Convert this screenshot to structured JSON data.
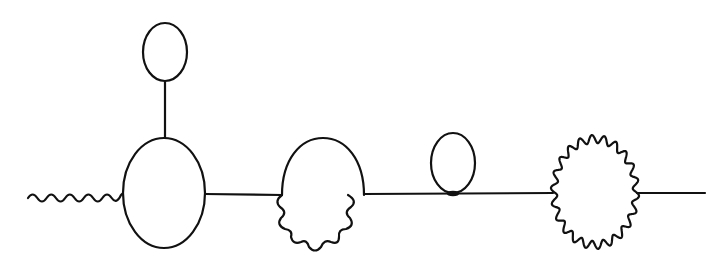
{
  "diagram": {
    "type": "feynman-diagram",
    "stroke_color": "#111111",
    "background": "#ffffff",
    "stroke_width": 2.2,
    "elements": [
      {
        "id": "external-photon",
        "kind": "wavy-line",
        "from": [
          28,
          196
        ],
        "to": [
          122,
          193
        ]
      },
      {
        "id": "vertex-blob",
        "kind": "ellipse",
        "cx": 164,
        "cy": 193,
        "rx": 41,
        "ry": 55
      },
      {
        "id": "tadpole-stem",
        "kind": "line",
        "from": [
          165,
          82
        ],
        "to": [
          165,
          138
        ]
      },
      {
        "id": "tadpole-top-loop",
        "kind": "ellipse",
        "cx": 165,
        "cy": 52,
        "rx": 22,
        "ry": 29
      },
      {
        "id": "propagator-1",
        "kind": "line",
        "from": [
          205,
          194
        ],
        "to": [
          282,
          195
        ]
      },
      {
        "id": "mixed-loop",
        "kind": "half-solid-half-wavy-loop",
        "cx": 323,
        "cy": 195,
        "rx": 41
      },
      {
        "id": "propagator-2",
        "kind": "line",
        "from": [
          364,
          194
        ],
        "to": [
          553,
          193
        ]
      },
      {
        "id": "tadpole-loop-2",
        "kind": "ellipse",
        "cx": 453,
        "cy": 163,
        "rx": 22,
        "ry": 30
      },
      {
        "id": "photon-loop",
        "kind": "wavy-ellipse",
        "cx": 595,
        "cy": 192,
        "rx": 41,
        "ry": 53
      },
      {
        "id": "propagator-3",
        "kind": "line",
        "from": [
          637,
          193
        ],
        "to": [
          705,
          193
        ]
      }
    ]
  }
}
